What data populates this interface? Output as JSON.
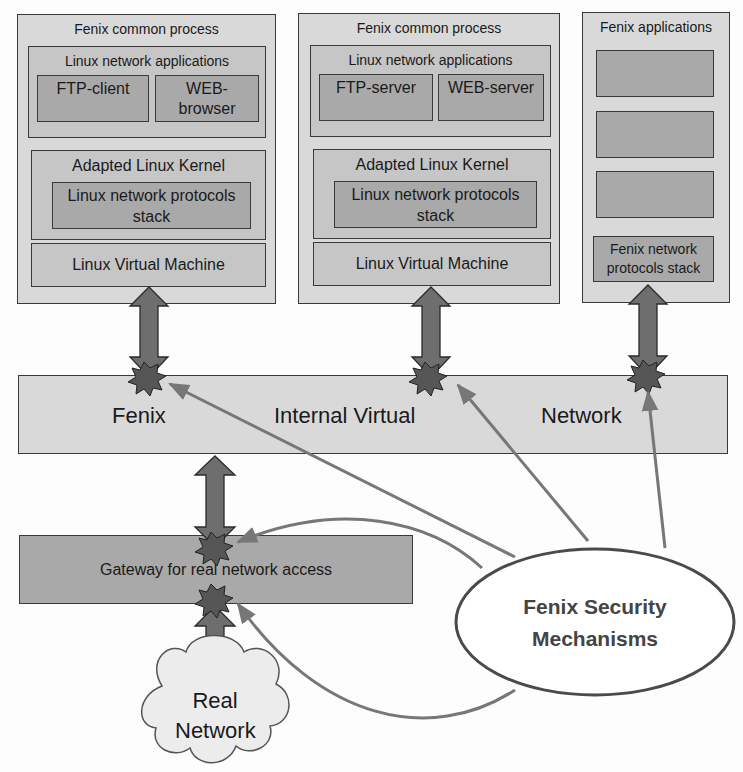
{
  "column1": {
    "title": "Fenix common process",
    "apps_group": "Linux network applications",
    "app_left": "FTP-client",
    "app_right": "WEB-\nbrowser",
    "kernel": "Adapted Linux Kernel",
    "stack": "Linux network protocols stack",
    "vm": "Linux Virtual Machine"
  },
  "column2": {
    "title": "Fenix common process",
    "apps_group": "Linux network applications",
    "app_left": "FTP-server",
    "app_right": "WEB-server",
    "kernel": "Adapted Linux Kernel",
    "stack": "Linux network protocols stack",
    "vm": "Linux Virtual Machine"
  },
  "column3": {
    "title": "Fenix applications",
    "stack": "Fenix network protocols stack"
  },
  "network": {
    "word1": "Fenix",
    "word2": "Internal Virtual",
    "word3": "Network"
  },
  "gateway": {
    "label": "Gateway for real network access"
  },
  "security": {
    "label": "Fenix Security Mechanisms"
  },
  "cloud": {
    "label": "Real Network"
  },
  "colors": {
    "outer": "#d9d9d9",
    "mid": "#c6c6c6",
    "inner": "#a9a9a9",
    "arrow": "#6e6e6e",
    "star": "#5a5a5a",
    "pointer": "#777777"
  }
}
